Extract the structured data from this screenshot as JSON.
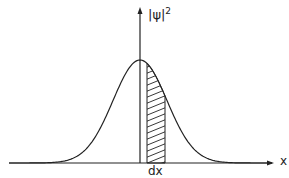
{
  "diagram": {
    "y_axis_label": "|ψ|",
    "y_axis_exp": "2",
    "x_axis_label": "x",
    "strip_label": "dx",
    "curve": "gaussian",
    "colors": {
      "stroke": "#222222",
      "background": "#ffffff"
    }
  }
}
